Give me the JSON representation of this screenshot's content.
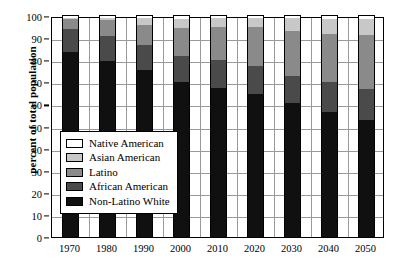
{
  "chart_data": {
    "type": "bar",
    "subtype": "stacked-bar-100-percent",
    "title": "",
    "xlabel": "",
    "ylabel": "percent of total population",
    "ylim": [
      0,
      100
    ],
    "ytick_step": 10,
    "yticks": [
      0,
      10,
      20,
      30,
      40,
      50,
      60,
      70,
      80,
      90,
      100
    ],
    "grid": true,
    "legend_position": "center-left-inside",
    "categories": [
      "1970",
      "1980",
      "1990",
      "2000",
      "2010",
      "2020",
      "2030",
      "2040",
      "2050"
    ],
    "series": [
      {
        "name": "Non-Latino White",
        "color": "#101010",
        "values": [
          83.5,
          79.5,
          75.5,
          70.0,
          67.5,
          64.5,
          60.5,
          56.5,
          53.0
        ]
      },
      {
        "name": "African American",
        "color": "#4a4a4a",
        "values": [
          10.5,
          11.5,
          11.5,
          12.0,
          12.5,
          13.0,
          12.5,
          13.5,
          14.0
        ]
      },
      {
        "name": "Latino",
        "color": "#8a8a8a",
        "values": [
          4.5,
          7.0,
          9.0,
          12.5,
          15.0,
          17.5,
          20.0,
          22.0,
          24.5
        ]
      },
      {
        "name": "Asian American",
        "color": "#c8c8c8",
        "values": [
          0.8,
          1.2,
          3.0,
          4.0,
          4.0,
          4.0,
          6.0,
          6.5,
          7.0
        ]
      },
      {
        "name": "Native American",
        "color": "#ffffff",
        "values": [
          0.7,
          0.8,
          1.0,
          1.5,
          1.0,
          1.0,
          1.0,
          1.5,
          1.5
        ]
      }
    ]
  },
  "legend": {
    "items": [
      {
        "label": "Native American",
        "color": "#ffffff"
      },
      {
        "label": "Asian American",
        "color": "#c8c8c8"
      },
      {
        "label": "Latino",
        "color": "#8a8a8a"
      },
      {
        "label": "African American",
        "color": "#4a4a4a"
      },
      {
        "label": "Non-Latino White",
        "color": "#101010"
      }
    ]
  },
  "axis": {
    "y_title": "percent of total population"
  }
}
